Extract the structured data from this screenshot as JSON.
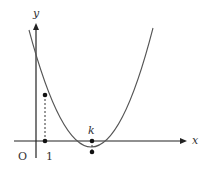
{
  "diagram": {
    "type": "parabola-graph",
    "axes": {
      "x_label": "x",
      "y_label": "y",
      "origin_label": "O"
    },
    "tick_labels": {
      "one": "1",
      "k": "k"
    },
    "colors": {
      "axis": "#222222",
      "curve": "#555555",
      "guide": "#333333",
      "point": "#111111",
      "text": "#333333"
    }
  }
}
